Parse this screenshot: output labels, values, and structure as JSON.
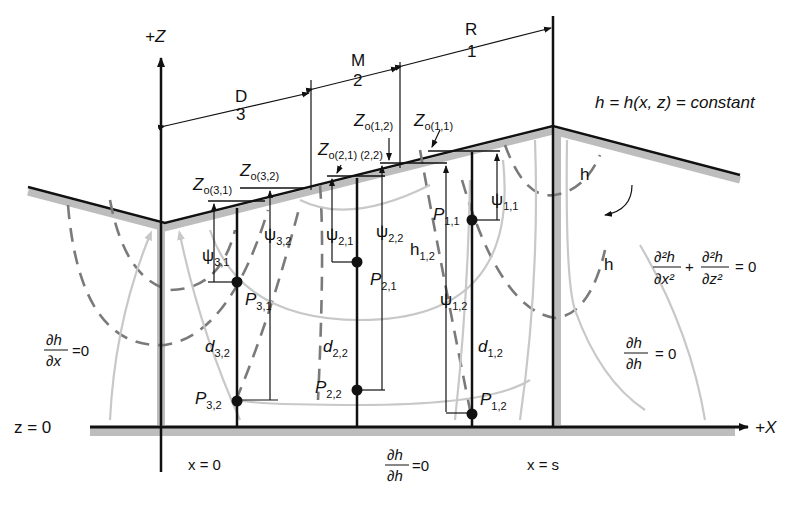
{
  "diagram": {
    "axes": {
      "z_axis_label": "+Z",
      "x_axis_label": "+X",
      "baseline_label": "z = 0",
      "left_boundary_label": "x = 0",
      "right_boundary_label": "x = s"
    },
    "zones": [
      {
        "letter": "R",
        "number": "1"
      },
      {
        "letter": "M",
        "number": "2"
      },
      {
        "letter": "D",
        "number": "3"
      }
    ],
    "surface_elevations": {
      "zo_11": {
        "main": "Z",
        "sub": "o(1,1)"
      },
      "zo_12": {
        "main": "Z",
        "sub": "o(1,2)"
      },
      "zo_21_22": {
        "main": "Z",
        "sub": "o(2,1) (2,2)"
      },
      "zo_32": {
        "main": "Z",
        "sub": "o(3,2)"
      },
      "zo_31": {
        "main": "Z",
        "sub": "o(3,1)"
      }
    },
    "equipotential": {
      "definition": "h = h(x, z) = constant",
      "label_h": "h"
    },
    "laplace_equation": {
      "term1_num": "∂²h",
      "term1_den": "∂x²",
      "plus": "+",
      "term2_num": "∂²h",
      "term2_den": "∂z²",
      "rhs": "= 0"
    },
    "boundary_conditions": {
      "left": {
        "num": "∂h",
        "den": "∂x",
        "rhs": "=0"
      },
      "right": {
        "num": "∂h",
        "den": "∂h",
        "rhs": "= 0"
      },
      "bottom": {
        "num": "∂h",
        "den": "∂h",
        "rhs": "=0"
      }
    },
    "points": [
      {
        "id": "P11",
        "main": "P",
        "sub": "1,1"
      },
      {
        "id": "P12",
        "main": "P",
        "sub": "1,2"
      },
      {
        "id": "P21",
        "main": "P",
        "sub": "2,1"
      },
      {
        "id": "P22",
        "main": "P",
        "sub": "2,2"
      },
      {
        "id": "P31",
        "main": "P",
        "sub": "3,1"
      },
      {
        "id": "P32",
        "main": "P",
        "sub": "3,2"
      }
    ],
    "pressure_heads": [
      {
        "id": "psi11",
        "main": "ψ",
        "sub": "1,1"
      },
      {
        "id": "psi12",
        "main": "ψ",
        "sub": "1,2"
      },
      {
        "id": "psi21",
        "main": "ψ",
        "sub": "2,1"
      },
      {
        "id": "psi22",
        "main": "ψ",
        "sub": "2,2"
      },
      {
        "id": "psi31",
        "main": "ψ",
        "sub": "3,1"
      },
      {
        "id": "psi32",
        "main": "ψ",
        "sub": "3,2"
      }
    ],
    "depths": [
      {
        "id": "d12",
        "main": "d",
        "sub": "1,2"
      },
      {
        "id": "d22",
        "main": "d",
        "sub": "2,2"
      },
      {
        "id": "d32",
        "main": "d",
        "sub": "3,2"
      }
    ],
    "hydraulic_head": {
      "main": "h",
      "sub": "1,2"
    }
  }
}
